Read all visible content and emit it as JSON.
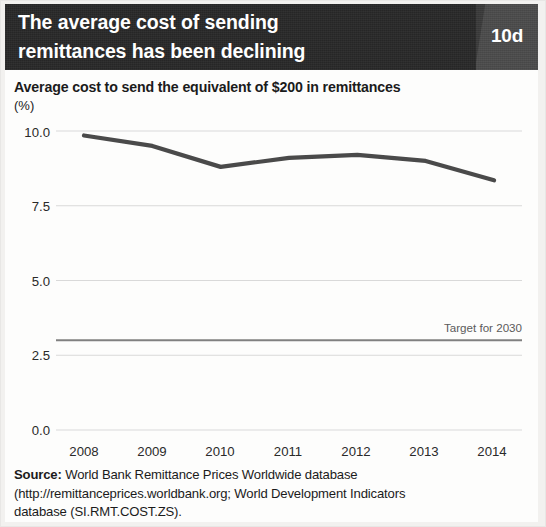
{
  "header": {
    "title_line1": "The average cost of sending",
    "title_line2": "remittances has been declining",
    "badge": "10d",
    "bg_color": "#262626",
    "badge_color": "#4b4b4b",
    "text_color": "#ffffff"
  },
  "source": {
    "label": "Source:",
    "line1": " World Bank Remittance Prices Worldwide database",
    "line2": "(http://remittanceprices.worldbank.org; World Development Indicators",
    "line3": "database (SI.RMT.COST.ZS)."
  },
  "chart_data": {
    "type": "line",
    "title": "Average cost to send the equivalent of $200 in remittances",
    "ylabel": "(%)",
    "xlabel": "",
    "categories": [
      "2008",
      "2009",
      "2010",
      "2011",
      "2012",
      "2013",
      "2014"
    ],
    "x": [
      2008,
      2009,
      2010,
      2011,
      2012,
      2013,
      2014
    ],
    "series": [
      {
        "name": "Average cost to send $200",
        "values": [
          9.85,
          9.5,
          8.8,
          9.1,
          9.2,
          9.0,
          8.35
        ],
        "color": "#4a4a4a"
      }
    ],
    "reference_lines": [
      {
        "label": "Target for 2030",
        "value": 3.0,
        "color": "#808080"
      }
    ],
    "yticks": [
      "10.0",
      "7.5",
      "5.0",
      "2.5",
      "0.0"
    ],
    "ytick_values": [
      10.0,
      7.5,
      5.0,
      2.5,
      0.0
    ],
    "ylim": [
      0.0,
      10.6
    ],
    "xlim": [
      2007.7,
      2014.3
    ],
    "grid": true,
    "grid_color": "#d9d9d9",
    "legend": "none"
  }
}
